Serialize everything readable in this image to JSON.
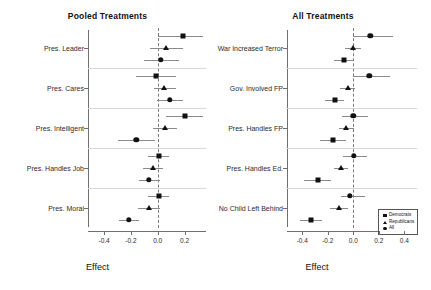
{
  "chart_data": [
    {
      "type": "scatter",
      "title": "Pooled Treatments",
      "xlabel": "Effect",
      "ylabel": "",
      "xlim": [
        -0.52,
        0.36
      ],
      "xticks": [
        -0.4,
        -0.2,
        0.0,
        0.2
      ],
      "xticklabels": [
        "-0.4",
        "-0.2",
        "0.0",
        "0.2"
      ],
      "grid": false,
      "zero_reference": 0.0,
      "legend": [
        "Democrats",
        "Republicans",
        "All"
      ],
      "categories": [
        "Pres. Leader",
        "Pres. Cares",
        "Pres. Intelligent",
        "Pres. Handles Job",
        "Pres. Moral"
      ],
      "series": [
        {
          "name": "Democrats",
          "marker": "square",
          "values": [
            0.19,
            -0.01,
            0.2,
            0.01,
            0.01
          ],
          "ci_low": [
            0.005,
            -0.16,
            0.06,
            -0.07,
            -0.07
          ],
          "ci_high": [
            0.34,
            0.135,
            0.335,
            0.085,
            0.085
          ]
        },
        {
          "name": "Republicans",
          "marker": "triangle",
          "values": [
            0.065,
            0.05,
            0.055,
            -0.035,
            -0.065
          ],
          "ci_low": [
            -0.055,
            -0.03,
            -0.035,
            -0.11,
            -0.145
          ],
          "ci_high": [
            0.19,
            0.135,
            0.145,
            0.04,
            0.015
          ]
        },
        {
          "name": "All",
          "marker": "circle",
          "values": [
            0.025,
            0.09,
            -0.16,
            -0.065,
            -0.215
          ],
          "ci_low": [
            -0.1,
            -0.005,
            -0.3,
            -0.14,
            -0.29
          ],
          "ci_high": [
            0.155,
            0.185,
            -0.02,
            0.015,
            -0.14
          ]
        }
      ]
    },
    {
      "type": "scatter",
      "title": "All Treatments",
      "xlabel": "Effect",
      "ylabel": "",
      "xlim": [
        -0.52,
        0.5
      ],
      "xticks": [
        -0.4,
        -0.2,
        0.0,
        0.2,
        0.4
      ],
      "xticklabels": [
        "-0.4",
        "-0.2",
        "0.0",
        "0.2",
        "0.4"
      ],
      "grid": false,
      "zero_reference": 0.0,
      "legend": [
        "Democrats",
        "Republicans",
        "All"
      ],
      "categories": [
        "War Increased Terror",
        "Gov. Involved FP",
        "Pres. Handles FP",
        "Pres. Handles Ed.",
        "No Child Left Behind"
      ],
      "series": [
        {
          "name": "Democrats",
          "marker": "circle",
          "values": [
            0.135,
            0.125,
            0.0,
            0.005,
            -0.025
          ],
          "ci_low": [
            -0.005,
            0.0,
            -0.085,
            -0.08,
            -0.1
          ],
          "ci_high": [
            0.31,
            0.29,
            0.115,
            0.11,
            0.095
          ]
        },
        {
          "name": "Republicans",
          "marker": "triangle",
          "values": [
            0.0,
            -0.04,
            -0.055,
            -0.095,
            -0.115
          ],
          "ci_low": [
            -0.065,
            -0.105,
            -0.115,
            -0.155,
            -0.18
          ],
          "ci_high": [
            0.06,
            0.01,
            0.005,
            -0.04,
            -0.045
          ]
        },
        {
          "name": "All",
          "marker": "square",
          "values": [
            -0.075,
            -0.145,
            -0.16,
            -0.28,
            -0.335
          ],
          "ci_low": [
            -0.155,
            -0.225,
            -0.265,
            -0.39,
            -0.415
          ],
          "ci_high": [
            0.005,
            -0.07,
            -0.055,
            -0.175,
            -0.245
          ]
        }
      ]
    }
  ],
  "panels": {
    "left": {
      "title": "Pooled Treatments",
      "axis_title": "Effect",
      "categories": [
        "Pres. Leader",
        "Pres. Cares",
        "Pres. Intelligent",
        "Pres. Handles Job",
        "Pres. Moral"
      ],
      "xticklabels": [
        "-0.4",
        "-0.2",
        "0.0",
        "0.2"
      ]
    },
    "right": {
      "title": "All Treatments",
      "axis_title": "Effect",
      "categories": [
        "War Increased Terror",
        "Gov. Involved FP",
        "Pres. Handles FP",
        "Pres. Handles Ed.",
        "No Child Left Behind"
      ],
      "xticklabels": [
        "-0.4",
        "-0.2",
        "0.0",
        "0.2",
        "0.4"
      ]
    }
  },
  "legend": {
    "items": [
      {
        "label": "Democrats",
        "marker": "square"
      },
      {
        "label": "Republicans",
        "marker": "triangle"
      },
      {
        "label": "All",
        "marker": "circle"
      }
    ]
  },
  "colors": {
    "marker": "#111111",
    "ci": "#8a8a8a",
    "zero_line": "#7a7a7a",
    "separator": "#d8d8d8",
    "axis": "#6f6f6f",
    "background": "#ffffff"
  }
}
